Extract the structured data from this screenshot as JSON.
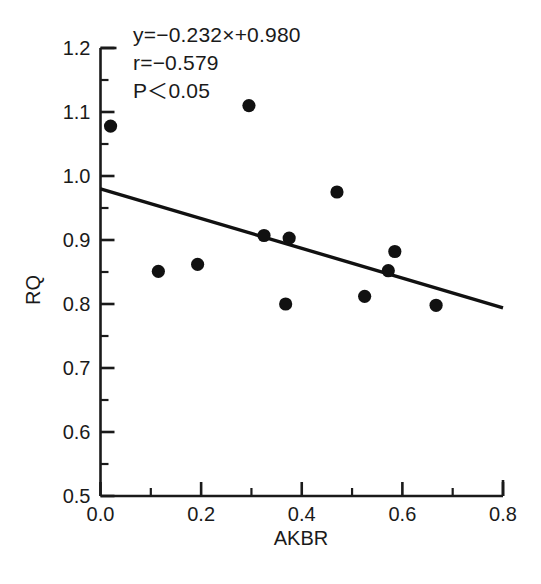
{
  "figure": {
    "caption_partial": "",
    "background": "#ffffff",
    "marker_color": "#111111",
    "line_color": "#111111",
    "axis_color": "#1a1a1a"
  },
  "annotations": {
    "equation": "y=−0.232×+0.980",
    "correlation": "r=−0.579",
    "significance": "P＜0.05"
  },
  "chart_data": {
    "type": "scatter",
    "title": "",
    "xlabel": "AKBR",
    "ylabel": "RQ",
    "xlim": [
      0.0,
      0.8
    ],
    "ylim": [
      0.5,
      1.2
    ],
    "xticks": [
      0.0,
      0.2,
      0.4,
      0.6,
      0.8
    ],
    "xtick_labels": [
      "0.0",
      "0.2",
      "0.4",
      "0.6",
      "0.8"
    ],
    "xminor_ticks": [
      0.1,
      0.3,
      0.5,
      0.7
    ],
    "yticks": [
      0.5,
      0.6,
      0.7,
      0.8,
      0.9,
      1.0,
      1.1,
      1.2
    ],
    "ytick_labels": [
      "0.5",
      "0.6",
      "0.7",
      "0.8",
      "0.9",
      "1.0",
      "1.1",
      "1.2"
    ],
    "yminor_ticks": [
      0.55,
      0.65,
      0.75,
      0.85,
      0.95,
      1.05,
      1.15
    ],
    "grid": false,
    "legend": null,
    "points": [
      {
        "x": 0.02,
        "y": 1.078
      },
      {
        "x": 0.115,
        "y": 0.851
      },
      {
        "x": 0.193,
        "y": 0.862
      },
      {
        "x": 0.295,
        "y": 1.11
      },
      {
        "x": 0.325,
        "y": 0.907
      },
      {
        "x": 0.368,
        "y": 0.8
      },
      {
        "x": 0.375,
        "y": 0.903
      },
      {
        "x": 0.47,
        "y": 0.975
      },
      {
        "x": 0.525,
        "y": 0.812
      },
      {
        "x": 0.572,
        "y": 0.852
      },
      {
        "x": 0.585,
        "y": 0.882
      },
      {
        "x": 0.667,
        "y": 0.798
      }
    ],
    "fit": {
      "slope": -0.232,
      "intercept": 0.98,
      "x_start": 0.0,
      "x_end": 0.8,
      "y_start": 0.98,
      "y_end": 0.794,
      "r": -0.579,
      "p": "<0.05"
    }
  }
}
